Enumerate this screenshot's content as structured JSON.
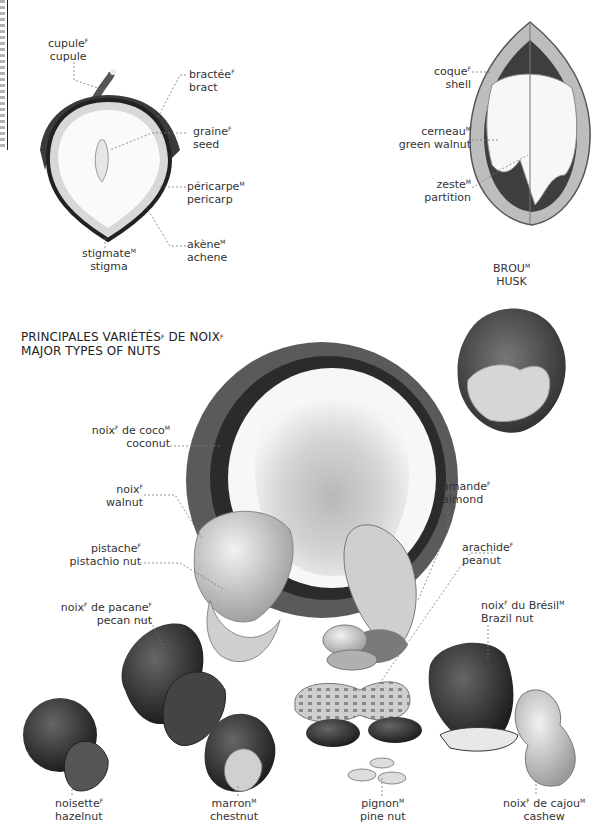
{
  "edge": {
    "cut_off_vertical_text": true
  },
  "section_hazelnut": {
    "labels": [
      {
        "id": "cupule",
        "fr": "cupule",
        "gender": "F",
        "en": "cupule"
      },
      {
        "id": "bract",
        "fr": "bractée",
        "gender": "F",
        "en": "bract"
      },
      {
        "id": "seed",
        "fr": "graine",
        "gender": "F",
        "en": "seed"
      },
      {
        "id": "pericarp",
        "fr": "péricarpe",
        "gender": "M",
        "en": "pericarp"
      },
      {
        "id": "stigma",
        "fr": "stigmate",
        "gender": "M",
        "en": "stigma"
      },
      {
        "id": "achene",
        "fr": "akène",
        "gender": "M",
        "en": "achene"
      }
    ]
  },
  "section_walnut": {
    "labels": [
      {
        "id": "shell",
        "fr": "coque",
        "gender": "F",
        "en": "shell"
      },
      {
        "id": "green-walnut",
        "fr": "cerneau",
        "gender": "M",
        "en": "green walnut"
      },
      {
        "id": "partition",
        "fr": "zeste",
        "gender": "M",
        "en": "partition"
      }
    ]
  },
  "husk": {
    "fr": "BROU",
    "gender": "M",
    "en": "HUSK"
  },
  "major_types": {
    "title_fr": "PRINCIPALES VARIÉTÉS",
    "title_fr_gender": "F",
    "title_fr_2": "DE NOIX",
    "title_fr_2_gender": "F",
    "title_en": "MAJOR TYPES OF NUTS",
    "nuts": [
      {
        "id": "coconut",
        "fr": "noix",
        "fr_gender": "F",
        "fr_2": "de coco",
        "fr_2_gender": "M",
        "en": "coconut"
      },
      {
        "id": "walnut",
        "fr": "noix",
        "fr_gender": "F",
        "en": "walnut"
      },
      {
        "id": "pistachio",
        "fr": "pistache",
        "fr_gender": "F",
        "en": "pistachio nut"
      },
      {
        "id": "almond",
        "fr": "amande",
        "fr_gender": "F",
        "en": "almond"
      },
      {
        "id": "peanut",
        "fr": "arachide",
        "fr_gender": "F",
        "en": "peanut"
      },
      {
        "id": "pecan",
        "fr": "noix",
        "fr_gender": "F",
        "fr_2": "de pacane",
        "fr_2_gender": "F",
        "en": "pecan nut"
      },
      {
        "id": "brazil",
        "fr": "noix",
        "fr_gender": "F",
        "fr_2": "du Brésil",
        "fr_2_gender": "M",
        "en": "Brazil nut"
      },
      {
        "id": "hazelnut",
        "fr": "noisette",
        "fr_gender": "F",
        "en": "hazelnut"
      },
      {
        "id": "chestnut",
        "fr": "marron",
        "fr_gender": "M",
        "en": "chestnut"
      },
      {
        "id": "pine-nut",
        "fr": "pignon",
        "fr_gender": "M",
        "en": "pine nut"
      },
      {
        "id": "cashew",
        "fr": "noix",
        "fr_gender": "F",
        "fr_2": "de cajou",
        "fr_2_gender": "M",
        "en": "cashew"
      }
    ]
  }
}
